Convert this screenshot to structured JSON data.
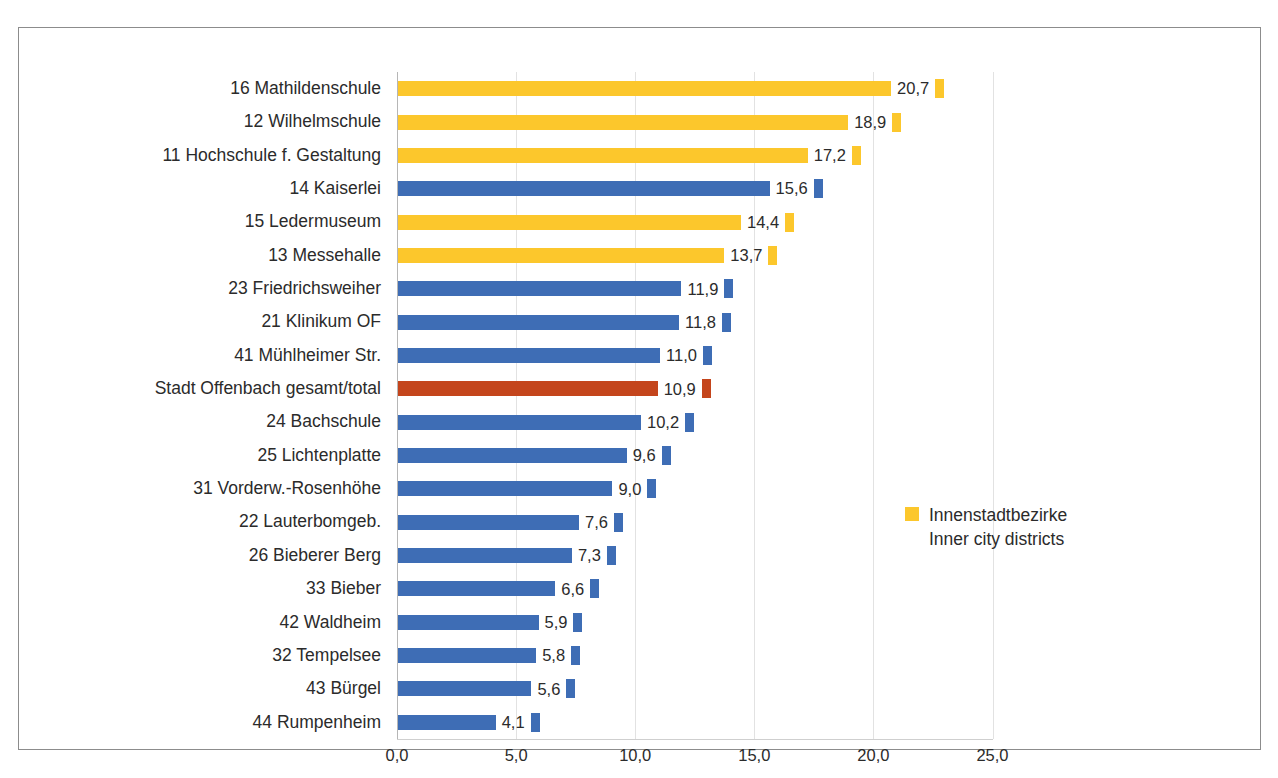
{
  "chart_data": {
    "type": "bar",
    "orientation": "horizontal",
    "title": "",
    "xlabel": "",
    "ylabel": "",
    "xlim": [
      0,
      25
    ],
    "xticks": [
      0,
      5,
      10,
      15,
      20,
      25
    ],
    "xtick_labels": [
      "0,0",
      "5,0",
      "10,0",
      "15,0",
      "20,0",
      "25,0"
    ],
    "grid": true,
    "grid_axis": "x",
    "legend_position": "center-right",
    "decimal_separator": ",",
    "categories": [
      "16 Mathildenschule",
      "12 Wilhelmschule",
      "11 Hochschule f. Gestaltung",
      "14 Kaiserlei",
      "15 Ledermuseum",
      "13 Messehalle",
      "23 Friedrichsweiher",
      "21 Klinikum OF",
      "41 Mühlheimer Str.",
      "Stadt Offenbach gesamt/total",
      "24 Bachschule",
      "25 Lichtenplatte",
      "31 Vorderw.-Rosenhöhe",
      "22 Lauterbomgeb.",
      "26 Bieberer Berg",
      "33 Bieber",
      "42 Waldheim",
      "32 Tempelsee",
      "43 Bürgel",
      "44 Rumpenheim"
    ],
    "values": [
      20.7,
      18.9,
      17.2,
      15.6,
      14.4,
      13.7,
      11.9,
      11.8,
      11.0,
      10.9,
      10.2,
      9.6,
      9.0,
      7.6,
      7.3,
      6.6,
      5.9,
      5.8,
      5.6,
      4.1
    ],
    "value_labels": [
      "20,7",
      "18,9",
      "17,2",
      "15,6",
      "14,4",
      "13,7",
      "11,9",
      "11,8",
      "11,0",
      "10,9",
      "10,2",
      "9,6",
      "9,0",
      "7,6",
      "7,3",
      "6,6",
      "5,9",
      "5,8",
      "5,6",
      "4,1"
    ],
    "bar_colors": [
      "inner-city",
      "inner-city",
      "inner-city",
      "outer",
      "inner-city",
      "inner-city",
      "outer",
      "outer",
      "outer",
      "total",
      "outer",
      "outer",
      "outer",
      "outer",
      "outer",
      "outer",
      "outer",
      "outer",
      "outer",
      "outer"
    ]
  },
  "colors": {
    "inner_city": "#fcc72c",
    "outer_district": "#3e6db5",
    "city_total": "#c4451c",
    "gridline": "#e2e2e2",
    "frame": "#8c8c8c",
    "text": "#2b2b2b"
  },
  "legend": {
    "swatch_color": "#fcc72c",
    "line1": "Innenstadtbezirke",
    "line2": "Inner city districts"
  }
}
